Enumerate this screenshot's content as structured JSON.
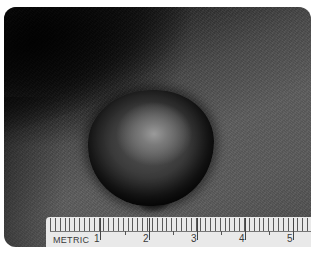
{
  "image": {
    "description": "Clinical close-up photograph of a dome-shaped pigmented skin nodule with a metric ruler for scale",
    "colors": {
      "background": "#ffffff",
      "skin_dark": "#0b0b0b",
      "skin_mid": "#5a5a5a",
      "lesion_dark": "#141414",
      "lesion_highlight": "#9a9a9a",
      "ruler": "#e9e9e9",
      "ruler_ink": "#3a3a3a"
    }
  },
  "ruler": {
    "unit_label": "METRIC",
    "marks": [
      "1",
      "2",
      "3",
      "4",
      "5"
    ]
  }
}
